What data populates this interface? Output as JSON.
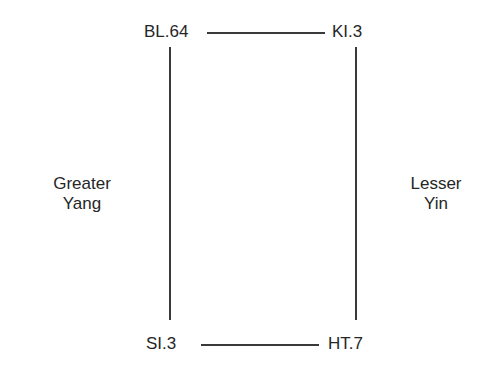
{
  "diagram": {
    "nodes": {
      "top_left": "BL.64",
      "top_right": "KI.3",
      "bottom_left": "SI.3",
      "bottom_right": "HT.7"
    },
    "left_label": {
      "line1": "Greater",
      "line2": "Yang"
    },
    "right_label": {
      "line1": "Lesser",
      "line2": "Yin"
    },
    "edges": [
      {
        "from": "BL.64",
        "to": "KI.3"
      },
      {
        "from": "SI.3",
        "to": "HT.7"
      },
      {
        "from": "BL.64",
        "to": "SI.3"
      },
      {
        "from": "KI.3",
        "to": "HT.7"
      }
    ],
    "colors": {
      "text": "#262626",
      "line": "#3a3a3a",
      "background": "#ffffff"
    }
  }
}
